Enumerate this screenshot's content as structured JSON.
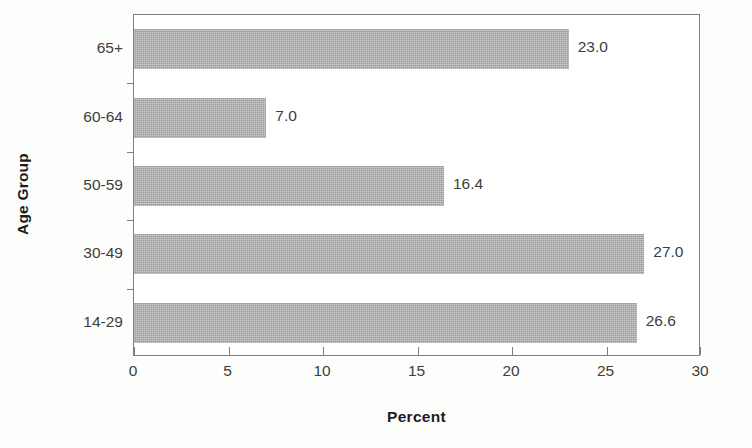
{
  "chart_data": {
    "type": "bar",
    "orientation": "horizontal",
    "title": "",
    "xlabel": "Percent",
    "ylabel": "Age Group",
    "categories": [
      "65+",
      "60-64",
      "50-59",
      "30-49",
      "14-29"
    ],
    "values": [
      23.0,
      7.0,
      16.4,
      27.0,
      26.6
    ],
    "value_labels": [
      "23.0",
      "7.0",
      "16.4",
      "27.0",
      "26.6"
    ],
    "xlim": [
      0,
      30
    ],
    "xticks": [
      0,
      5,
      10,
      15,
      20,
      25,
      30
    ],
    "xtick_labels": [
      "0",
      "5",
      "10",
      "15",
      "20",
      "25",
      "30"
    ],
    "grid": false,
    "legend": "none",
    "bar_color": "#9b9b9b",
    "axis_color": "#7e7e7e",
    "text_color": "#3d3d3d",
    "background_color": "#fdfdfc"
  }
}
